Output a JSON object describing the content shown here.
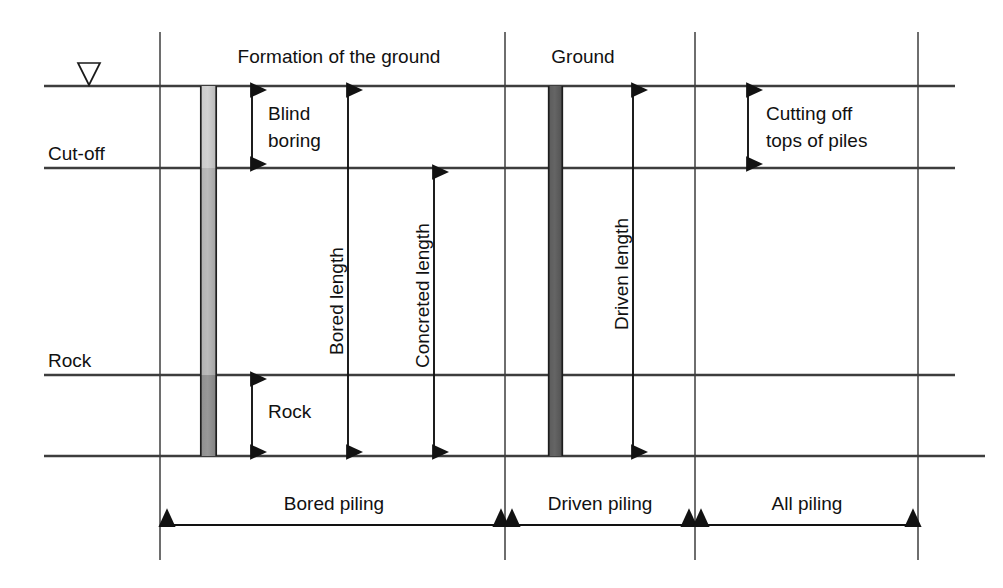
{
  "figure": {
    "type": "engineering-section-diagram"
  },
  "strata_labels": {
    "cut_off": "Cut-off",
    "rock": "Rock"
  },
  "top_labels": {
    "formation": "Formation of the ground",
    "ground": "Ground"
  },
  "dimension_labels": {
    "blind_boring": "Blind boring",
    "blind_boring_line1": "Blind",
    "blind_boring_line2": "boring",
    "bored_length": "Bored length",
    "concreted_length": "Concreted length",
    "driven_length": "Driven length",
    "rock": "Rock",
    "cutting_off": "Cutting off tops of piles",
    "cutting_off_line1": "Cutting off",
    "cutting_off_line2": "tops of piles"
  },
  "footer_spans": [
    {
      "label": "Bored piling",
      "x1": 163,
      "x2": 505
    },
    {
      "label": "Driven piling",
      "x1": 508,
      "x2": 693
    },
    {
      "label": "All piling",
      "x1": 697,
      "x2": 917
    }
  ],
  "levels": {
    "ground_y": 86,
    "cut_off_y": 168,
    "rock_y": 375,
    "toe_y": 456
  },
  "verticals": [
    160,
    505,
    695,
    918
  ],
  "piles": {
    "bored": {
      "x": 200,
      "width": 17,
      "top": 86,
      "bottom": 456,
      "fill_upper": "#bdbdbd",
      "fill_middle": "#a8a8a8",
      "fill_rock": "#8a8a8a"
    },
    "driven": {
      "x": 548,
      "width": 15,
      "top": 86,
      "bottom": 456,
      "fill": "#5e5e5e"
    }
  },
  "colors": {
    "line": "#3d3d3d",
    "grid": "#4a4a4a",
    "dimension": "#121212",
    "text": "#111111",
    "background": "#ffffff"
  }
}
